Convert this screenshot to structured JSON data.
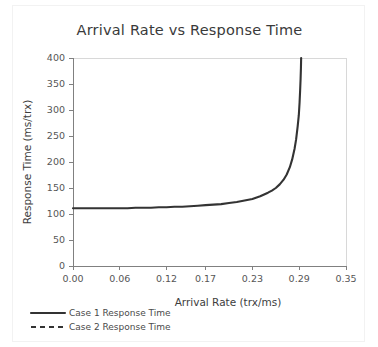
{
  "chart_data": {
    "type": "line",
    "title": "Arrival Rate vs Response Time",
    "xlabel": "Arrival Rate (trx/ms)",
    "ylabel": "Response Time (ms/trx)",
    "xlim": [
      0.0,
      0.35
    ],
    "ylim": [
      0,
      400
    ],
    "xticks": [
      "0.00",
      "0.06",
      "0.12",
      "0.17",
      "0.23",
      "0.29",
      "0.35"
    ],
    "xtick_values": [
      0.0,
      0.06,
      0.12,
      0.17,
      0.23,
      0.29,
      0.35
    ],
    "yticks": [
      "0",
      "50",
      "100",
      "150",
      "200",
      "250",
      "300",
      "350",
      "400"
    ],
    "ytick_values": [
      0,
      50,
      100,
      150,
      200,
      250,
      300,
      350,
      400
    ],
    "grid": false,
    "legend_position": "bottom-left",
    "series": [
      {
        "name": "Case 1 Response Time",
        "style": "solid",
        "color": "#333333",
        "asymptote_x": 0.295,
        "baseline_y": 111,
        "x": [
          0.0,
          0.01,
          0.02,
          0.03,
          0.04,
          0.05,
          0.06,
          0.07,
          0.08,
          0.09,
          0.1,
          0.11,
          0.12,
          0.13,
          0.14,
          0.15,
          0.16,
          0.17,
          0.18,
          0.19,
          0.2,
          0.21,
          0.22,
          0.23,
          0.24,
          0.25,
          0.255,
          0.26,
          0.265,
          0.27,
          0.274,
          0.278,
          0.281,
          0.284,
          0.286,
          0.288,
          0.2895,
          0.2905,
          0.2912,
          0.2918,
          0.2922,
          0.2925
        ],
        "y": [
          111,
          111,
          111,
          111,
          111,
          111,
          111,
          111,
          112,
          112,
          112,
          113,
          113,
          114,
          114,
          115,
          116,
          117,
          118,
          119,
          121,
          123,
          126,
          129,
          134,
          141,
          145,
          150,
          157,
          166,
          176,
          190,
          205,
          225,
          243,
          268,
          290,
          315,
          338,
          360,
          380,
          400
        ]
      },
      {
        "name": "Case 2 Response Time",
        "style": "dashed",
        "color": "#333333",
        "x": [],
        "y": []
      }
    ]
  },
  "legend": {
    "items": [
      {
        "label": "Case 1 Response Time",
        "style": "solid"
      },
      {
        "label": "Case 2 Response Time",
        "style": "dashed"
      }
    ]
  }
}
